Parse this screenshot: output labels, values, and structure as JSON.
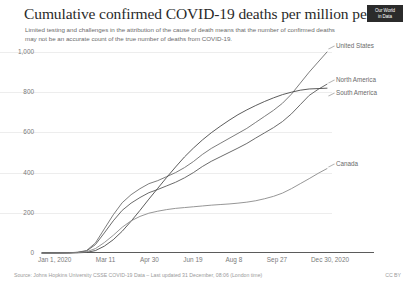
{
  "header": {
    "title": "Cumulative confirmed COVID-19 deaths per million people",
    "subtitle": "Limited testing and challenges in the attribution of the cause of death means that the number of confirmed deaths may not be an accurate count of the true number of deaths from COVID-19.",
    "logo_line1": "Our World",
    "logo_line2": "in Data"
  },
  "footer": {
    "source": "Source: Johns Hopkins University CSSE COVID-19 Data – Last updated 31 December, 08:06 (London time)",
    "license": "CC BY"
  },
  "chart_data": {
    "type": "line",
    "title": "Cumulative confirmed COVID-19 deaths per million people",
    "xlabel": "",
    "ylabel": "",
    "ylim": [
      0,
      1000
    ],
    "yticks": [
      0,
      200,
      400,
      600,
      800,
      1000
    ],
    "ytick_labels": [
      "0",
      "200",
      "400",
      "600",
      "800",
      "1,000"
    ],
    "grid": true,
    "legend_position": "right-inline",
    "xtick_labels": [
      "Jan 1, 2020",
      "Mar 11",
      "Apr 30",
      "Jun 19",
      "Aug 8",
      "Sep 27",
      "Dec 30, 2020"
    ],
    "x": [
      "Jan 1",
      "Feb 10",
      "Mar 1",
      "Mar 11",
      "Mar 21",
      "Mar 31",
      "Apr 10",
      "Apr 20",
      "Apr 30",
      "May 10",
      "May 20",
      "May 30",
      "Jun 9",
      "Jun 19",
      "Jun 29",
      "Jul 9",
      "Jul 19",
      "Jul 29",
      "Aug 8",
      "Aug 18",
      "Aug 28",
      "Sep 7",
      "Sep 17",
      "Sep 27",
      "Oct 7",
      "Oct 17",
      "Oct 27",
      "Nov 6",
      "Nov 16",
      "Nov 26",
      "Dec 6",
      "Dec 16",
      "Dec 30"
    ],
    "series": [
      {
        "name": "United States",
        "color": "#6e6e6e",
        "end_value": 1000,
        "values": [
          0,
          0,
          0.2,
          1,
          4,
          12,
          50,
          120,
          190,
          250,
          290,
          320,
          345,
          360,
          380,
          400,
          425,
          455,
          490,
          520,
          545,
          570,
          595,
          620,
          650,
          680,
          710,
          745,
          790,
          845,
          900,
          950,
          1000
        ]
      },
      {
        "name": "North America",
        "color": "#5a5a5a",
        "end_value": 840,
        "values": [
          0,
          0,
          0.2,
          0.8,
          3,
          10,
          42,
          100,
          160,
          212,
          248,
          276,
          300,
          316,
          334,
          352,
          374,
          400,
          430,
          456,
          478,
          500,
          522,
          545,
          572,
          598,
          624,
          654,
          692,
          738,
          784,
          814,
          840
        ]
      },
      {
        "name": "South America",
        "color": "#4a4a4a",
        "end_value": 820,
        "values": [
          0,
          0,
          0,
          0.2,
          1,
          3,
          12,
          34,
          66,
          108,
          158,
          212,
          268,
          322,
          376,
          428,
          478,
          522,
          562,
          598,
          630,
          660,
          688,
          712,
          734,
          754,
          772,
          788,
          800,
          810,
          816,
          818,
          820
        ]
      },
      {
        "name": "Canada",
        "color": "#8a8a8a",
        "end_value": 420,
        "values": [
          0,
          0,
          0.1,
          0.4,
          2,
          6,
          22,
          52,
          88,
          128,
          160,
          182,
          198,
          208,
          216,
          222,
          226,
          230,
          234,
          238,
          241,
          244,
          248,
          253,
          260,
          270,
          282,
          298,
          320,
          345,
          370,
          396,
          420
        ]
      }
    ]
  }
}
